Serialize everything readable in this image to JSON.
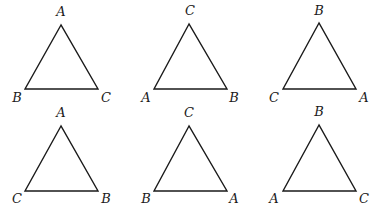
{
  "figure": {
    "stroke_color": "#1a1a1a",
    "background": "#ffffff",
    "triangles": [
      {
        "id": "t1",
        "row": 1,
        "col": 1,
        "vertices": {
          "top": [
            61,
            25
          ],
          "left": [
            25,
            89
          ],
          "right": [
            98,
            89
          ]
        },
        "labels": {
          "top": "A",
          "left": "B",
          "right": "C"
        },
        "label_pos": {
          "top": [
            61,
            16
          ],
          "left": [
            17,
            102
          ],
          "right": [
            106,
            102
          ]
        }
      },
      {
        "id": "t2",
        "row": 1,
        "col": 2,
        "vertices": {
          "top": [
            189,
            24
          ],
          "left": [
            154,
            89
          ],
          "right": [
            227,
            89
          ]
        },
        "labels": {
          "top": "C",
          "left": "A",
          "right": "B"
        },
        "label_pos": {
          "top": [
            190,
            15
          ],
          "left": [
            146,
            102
          ],
          "right": [
            234,
            102
          ]
        }
      },
      {
        "id": "t3",
        "row": 1,
        "col": 3,
        "vertices": {
          "top": [
            319,
            23
          ],
          "left": [
            283,
            89
          ],
          "right": [
            356,
            89
          ]
        },
        "labels": {
          "top": "B",
          "left": "C",
          "right": "A"
        },
        "label_pos": {
          "top": [
            319,
            15
          ],
          "left": [
            274,
            102
          ],
          "right": [
            364,
            102
          ]
        }
      },
      {
        "id": "t4",
        "row": 2,
        "col": 1,
        "vertices": {
          "top": [
            61,
            126
          ],
          "left": [
            25,
            191
          ],
          "right": [
            98,
            191
          ]
        },
        "labels": {
          "top": "A",
          "left": "C",
          "right": "B"
        },
        "label_pos": {
          "top": [
            61,
            117
          ],
          "left": [
            17,
            203
          ],
          "right": [
            106,
            203
          ]
        }
      },
      {
        "id": "t5",
        "row": 2,
        "col": 2,
        "vertices": {
          "top": [
            189,
            126
          ],
          "left": [
            154,
            191
          ],
          "right": [
            227,
            191
          ]
        },
        "labels": {
          "top": "C",
          "left": "B",
          "right": "A"
        },
        "label_pos": {
          "top": [
            189,
            117
          ],
          "left": [
            146,
            203
          ],
          "right": [
            234,
            203
          ]
        }
      },
      {
        "id": "t6",
        "row": 2,
        "col": 3,
        "vertices": {
          "top": [
            319,
            125
          ],
          "left": [
            283,
            191
          ],
          "right": [
            356,
            191
          ]
        },
        "labels": {
          "top": "B",
          "left": "A",
          "right": "C"
        },
        "label_pos": {
          "top": [
            319,
            116
          ],
          "left": [
            274,
            203
          ],
          "right": [
            364,
            203
          ]
        }
      }
    ]
  }
}
